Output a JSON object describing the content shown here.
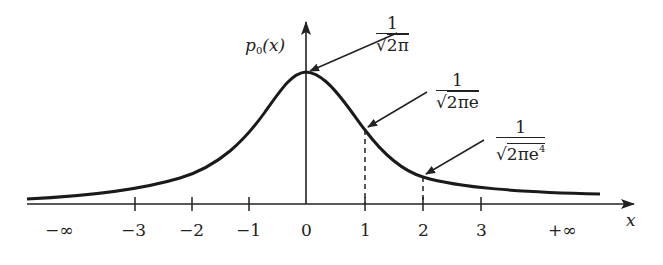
{
  "diagram": {
    "y_axis_label": {
      "base": "p",
      "subscript": "0",
      "arg": "(x)"
    },
    "x_axis_label": "x",
    "x_ticks": [
      {
        "label": "−∞",
        "x": 60
      },
      {
        "label": "−3",
        "x": 135
      },
      {
        "label": "−2",
        "x": 192
      },
      {
        "label": "−1",
        "x": 249
      },
      {
        "label": "0",
        "x": 306
      },
      {
        "label": "1",
        "x": 365
      },
      {
        "label": "2",
        "x": 423
      },
      {
        "label": "3",
        "x": 481
      },
      {
        "label": "+∞",
        "x": 565
      }
    ],
    "annotations": [
      {
        "id": "peak",
        "numerator": "1",
        "radicand": "2π",
        "radicand_sup": "",
        "points_to_x": 0
      },
      {
        "id": "x1",
        "numerator": "1",
        "radicand": "2πe",
        "radicand_sup": "",
        "points_to_x": 1
      },
      {
        "id": "x2",
        "numerator": "1",
        "radicand": "2πe",
        "radicand_sup": "4",
        "points_to_x": 2
      }
    ],
    "curve": "p0(x) — bell-shaped density, maximum at x = 0, decaying toward ±∞",
    "colors": {
      "ink": "#222222",
      "background": "#ffffff"
    }
  }
}
